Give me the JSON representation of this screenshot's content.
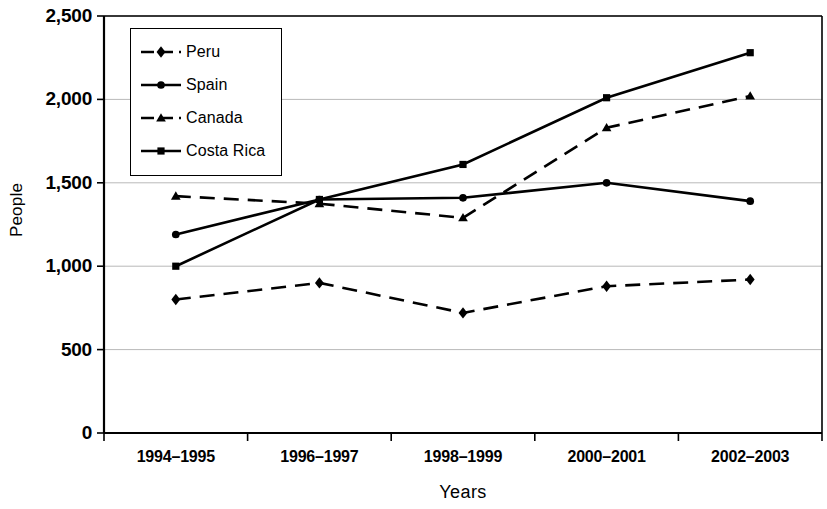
{
  "chart_data": {
    "type": "line",
    "title": "",
    "xlabel": "Years",
    "ylabel": "People",
    "categories": [
      "1994–1995",
      "1996–1997",
      "1998–1999",
      "2000–2001",
      "2002–2003"
    ],
    "ylim": [
      0,
      2500
    ],
    "yticks": [
      0,
      500,
      1000,
      1500,
      2000,
      2500
    ],
    "ytick_labels": [
      "0",
      "500",
      "1,000",
      "1,500",
      "2,000",
      "2,500"
    ],
    "grid": "horizontal",
    "legend_position": "upper-left-inside",
    "series": [
      {
        "name": "Peru",
        "values": [
          800,
          900,
          720,
          880,
          920
        ],
        "marker": "diamond",
        "line_style": "dashed",
        "color": "#000000"
      },
      {
        "name": "Spain",
        "values": [
          1190,
          1400,
          1410,
          1500,
          1390
        ],
        "marker": "circle",
        "line_style": "solid",
        "color": "#000000"
      },
      {
        "name": "Canada",
        "values": [
          1420,
          1375,
          1290,
          1830,
          2020
        ],
        "marker": "triangle",
        "line_style": "dashed",
        "color": "#000000"
      },
      {
        "name": "Costa Rica",
        "values": [
          1000,
          1400,
          1610,
          2010,
          2280
        ],
        "marker": "square",
        "line_style": "solid",
        "color": "#000000"
      }
    ]
  }
}
